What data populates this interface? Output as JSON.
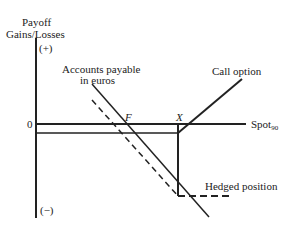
{
  "diagram": {
    "y_axis_title_line1": "Payoff",
    "y_axis_title_line2": "Gains/Losses",
    "y_plus": "(+)",
    "y_minus": "(−)",
    "zero": "0",
    "x_axis_label": "Spot",
    "x_axis_subscript": "90",
    "forward_label": "F",
    "strike_label": "X",
    "accounts_payable_line1": "Accounts payable",
    "accounts_payable_line2": "in euros",
    "call_option": "Call option",
    "hedged_position": "Hedged position"
  }
}
